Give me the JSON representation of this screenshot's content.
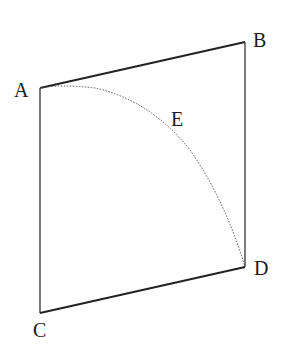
{
  "diagram": {
    "type": "geometry",
    "shape": "quadrilateral",
    "points": {
      "A": {
        "label": "A",
        "x": 40,
        "y": 88
      },
      "B": {
        "label": "B",
        "x": 245,
        "y": 42
      },
      "D": {
        "label": "D",
        "x": 245,
        "y": 267
      },
      "C": {
        "label": "C",
        "x": 40,
        "y": 313
      }
    },
    "curve": {
      "label": "E",
      "from": "A",
      "to": "D",
      "style": "dotted"
    },
    "colors": {
      "stroke": "#222222",
      "background": "#ffffff"
    }
  }
}
